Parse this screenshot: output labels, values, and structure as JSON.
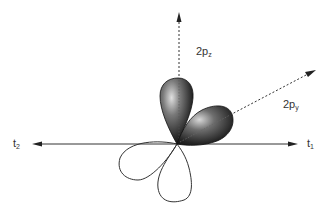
{
  "figure": {
    "type": "orbital-diagram",
    "colors": {
      "axis": "#333333",
      "lobe_fill_dark": "#1a1a1a",
      "lobe_fill_light": "#d8d8d8",
      "outline_lobe": "#333333",
      "background": "#ffffff"
    }
  },
  "labels": {
    "pz": {
      "main": "2p",
      "sub": "z"
    },
    "py": {
      "main": "2p",
      "sub": "y"
    },
    "t1": {
      "main": "t",
      "sub": "1"
    },
    "t2": {
      "main": "t",
      "sub": "2"
    }
  },
  "axes": [
    {
      "name": "2pz-axis",
      "style": "dashed",
      "direction": "up"
    },
    {
      "name": "2py-axis",
      "style": "dashed",
      "direction": "upper-right"
    },
    {
      "name": "t1-axis",
      "style": "solid",
      "direction": "right"
    },
    {
      "name": "t2-axis",
      "style": "solid",
      "direction": "left"
    }
  ]
}
